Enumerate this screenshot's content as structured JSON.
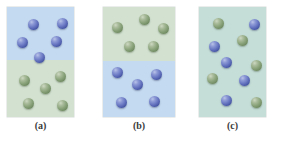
{
  "figure": {
    "caption_style": "lettered-panels",
    "background_color": "#ffffff",
    "width": 282,
    "height": 145
  },
  "colors": {
    "blue_region": "#c4daf0",
    "green_region": "#d3e2d0",
    "mixed_region": "#c5ded8",
    "blue_sphere": "#6b79c4",
    "green_sphere": "#8ba47c",
    "label_text": "#3b3b3b"
  },
  "panels": [
    {
      "id": "panel-a",
      "label": "(a)",
      "box": {
        "x": 7,
        "y": 7,
        "w": 67,
        "h": 110
      },
      "label_box": {
        "x": 7,
        "y": 120,
        "w": 67
      },
      "layout": "two-layer",
      "regions": [
        {
          "name": "upper-layer",
          "color": "#c4daf0",
          "height_pct": 48
        },
        {
          "name": "lower-layer",
          "color": "#d3e2d0",
          "height_pct": 52
        }
      ],
      "spheres": [
        {
          "type": "blue",
          "x": 21,
          "y": 12,
          "d": 11
        },
        {
          "type": "blue",
          "x": 50,
          "y": 11,
          "d": 11
        },
        {
          "type": "blue",
          "x": 10,
          "y": 30,
          "d": 11
        },
        {
          "type": "blue",
          "x": 44,
          "y": 29,
          "d": 11
        },
        {
          "type": "blue",
          "x": 27,
          "y": 45,
          "d": 11
        },
        {
          "type": "green",
          "x": 12,
          "y": 68,
          "d": 11
        },
        {
          "type": "green",
          "x": 48,
          "y": 64,
          "d": 11
        },
        {
          "type": "green",
          "x": 33,
          "y": 76,
          "d": 11
        },
        {
          "type": "green",
          "x": 16,
          "y": 91,
          "d": 11
        },
        {
          "type": "green",
          "x": 50,
          "y": 93,
          "d": 11
        }
      ],
      "blue_count": 5,
      "green_count": 5
    },
    {
      "id": "panel-b",
      "label": "(b)",
      "box": {
        "x": 103,
        "y": 7,
        "w": 72,
        "h": 110
      },
      "label_box": {
        "x": 103,
        "y": 120,
        "w": 72
      },
      "layout": "two-layer",
      "regions": [
        {
          "name": "upper-layer",
          "color": "#d3e2d0",
          "height_pct": 49
        },
        {
          "name": "lower-layer",
          "color": "#c4daf0",
          "height_pct": 51
        }
      ],
      "spheres": [
        {
          "type": "green",
          "x": 9,
          "y": 15,
          "d": 11
        },
        {
          "type": "green",
          "x": 36,
          "y": 7,
          "d": 11
        },
        {
          "type": "green",
          "x": 55,
          "y": 16,
          "d": 11
        },
        {
          "type": "green",
          "x": 21,
          "y": 34,
          "d": 11
        },
        {
          "type": "green",
          "x": 45,
          "y": 34,
          "d": 11
        },
        {
          "type": "blue",
          "x": 9,
          "y": 60,
          "d": 11
        },
        {
          "type": "blue",
          "x": 48,
          "y": 62,
          "d": 11
        },
        {
          "type": "blue",
          "x": 29,
          "y": 72,
          "d": 11
        },
        {
          "type": "blue",
          "x": 13,
          "y": 90,
          "d": 11
        },
        {
          "type": "blue",
          "x": 46,
          "y": 89,
          "d": 11
        }
      ],
      "blue_count": 5,
      "green_count": 5
    },
    {
      "id": "panel-c",
      "label": "(c)",
      "box": {
        "x": 199,
        "y": 7,
        "w": 67,
        "h": 110
      },
      "label_box": {
        "x": 199,
        "y": 120,
        "w": 67
      },
      "layout": "uniform",
      "regions": [
        {
          "name": "mixed-layer",
          "color": "#c5ded8",
          "height_pct": 100
        }
      ],
      "spheres": [
        {
          "type": "green",
          "x": 14,
          "y": 11,
          "d": 11
        },
        {
          "type": "blue",
          "x": 50,
          "y": 12,
          "d": 11
        },
        {
          "type": "green",
          "x": 38,
          "y": 28,
          "d": 11
        },
        {
          "type": "blue",
          "x": 10,
          "y": 34,
          "d": 11
        },
        {
          "type": "blue",
          "x": 22,
          "y": 50,
          "d": 11
        },
        {
          "type": "green",
          "x": 52,
          "y": 53,
          "d": 11
        },
        {
          "type": "green",
          "x": 8,
          "y": 66,
          "d": 11
        },
        {
          "type": "blue",
          "x": 40,
          "y": 68,
          "d": 11
        },
        {
          "type": "blue",
          "x": 22,
          "y": 88,
          "d": 11
        },
        {
          "type": "green",
          "x": 52,
          "y": 90,
          "d": 11
        }
      ],
      "blue_count": 5,
      "green_count": 5
    }
  ]
}
